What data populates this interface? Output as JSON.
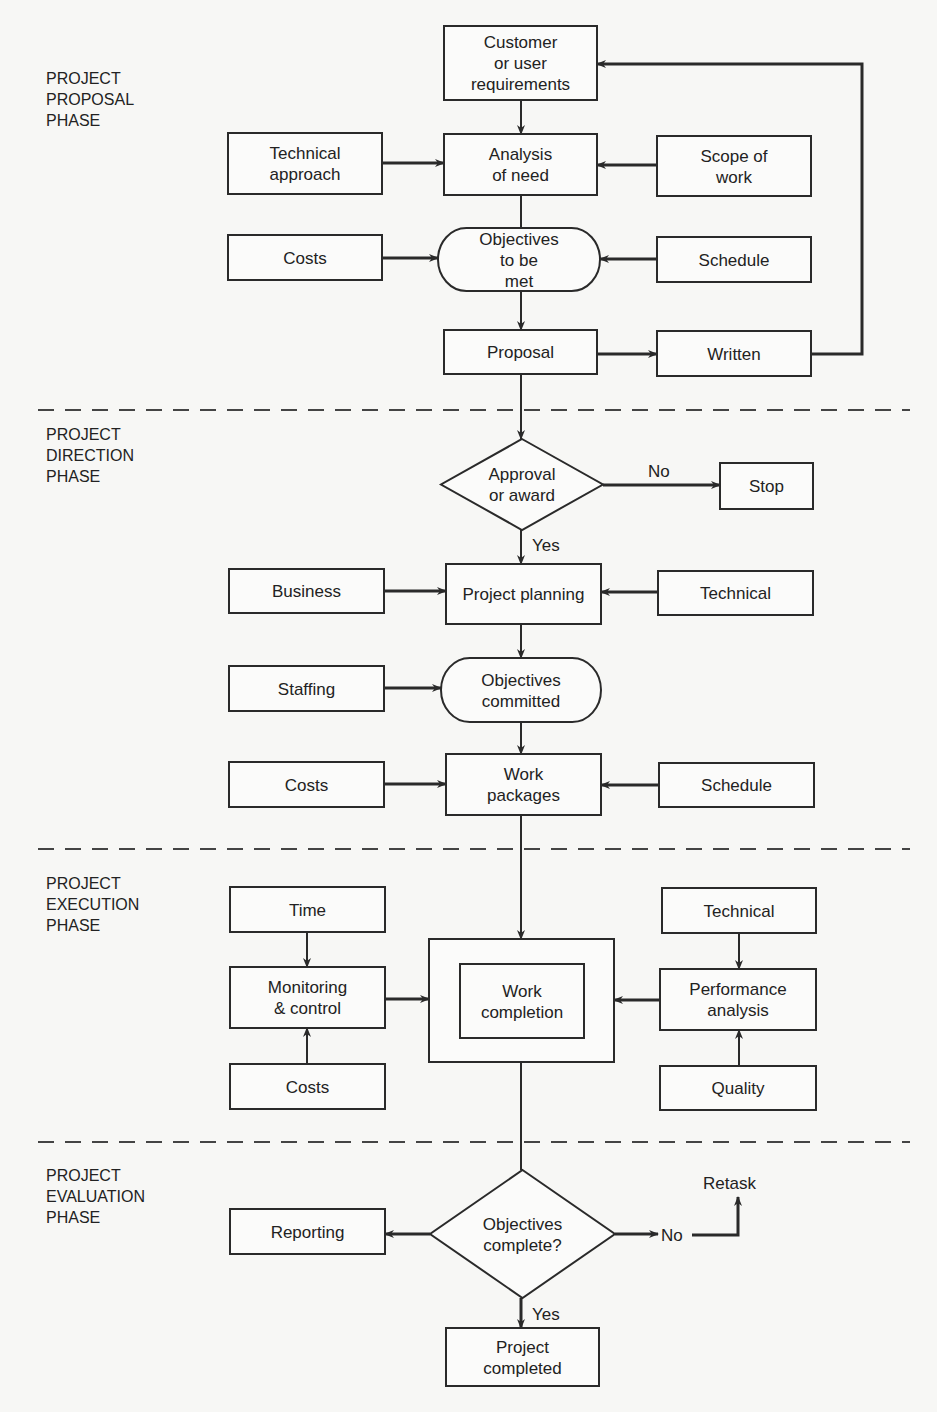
{
  "phases": [
    {
      "id": "proposal",
      "lines": [
        "PROJECT",
        "PROPOSAL",
        "PHASE"
      ],
      "x": 46,
      "y": 84
    },
    {
      "id": "direction",
      "lines": [
        "PROJECT",
        "DIRECTION",
        "PHASE"
      ],
      "x": 46,
      "y": 440
    },
    {
      "id": "execution",
      "lines": [
        "PROJECT",
        "EXECUTION",
        "PHASE"
      ],
      "x": 46,
      "y": 889
    },
    {
      "id": "evaluation",
      "lines": [
        "PROJECT",
        "EVALUATION",
        "PHASE"
      ],
      "x": 46,
      "y": 1181
    }
  ],
  "dividers": [
    410,
    849,
    1142
  ],
  "nodes": [
    {
      "id": "customer-requirements",
      "shape": "rect",
      "x": 444,
      "y": 26,
      "w": 153,
      "h": 74,
      "lines": [
        "Customer",
        "or user",
        "requirements"
      ]
    },
    {
      "id": "technical-approach",
      "shape": "rect",
      "x": 228,
      "y": 133,
      "w": 154,
      "h": 61,
      "lines": [
        "Technical",
        "approach"
      ]
    },
    {
      "id": "analysis-of-need",
      "shape": "rect",
      "x": 444,
      "y": 134,
      "w": 153,
      "h": 61,
      "lines": [
        "Analysis",
        "of need"
      ]
    },
    {
      "id": "scope-of-work",
      "shape": "rect",
      "x": 657,
      "y": 136,
      "w": 154,
      "h": 60,
      "lines": [
        "Scope of",
        "work"
      ]
    },
    {
      "id": "costs-proposal",
      "shape": "rect",
      "x": 228,
      "y": 235,
      "w": 154,
      "h": 45,
      "lines": [
        "Costs"
      ]
    },
    {
      "id": "objectives-to-be-met",
      "shape": "terminator",
      "x": 438,
      "y": 228,
      "w": 162,
      "h": 63,
      "lines": [
        "Objectives",
        "to be",
        "met"
      ]
    },
    {
      "id": "schedule-proposal",
      "shape": "rect",
      "x": 657,
      "y": 237,
      "w": 154,
      "h": 45,
      "lines": [
        "Schedule"
      ]
    },
    {
      "id": "proposal",
      "shape": "rect",
      "x": 444,
      "y": 330,
      "w": 153,
      "h": 44,
      "lines": [
        "Proposal"
      ]
    },
    {
      "id": "written",
      "shape": "rect",
      "x": 657,
      "y": 331,
      "w": 154,
      "h": 45,
      "lines": [
        "Written"
      ]
    },
    {
      "id": "approval-or-award",
      "shape": "diamond",
      "x": 441,
      "y": 439,
      "w": 162,
      "h": 91,
      "lines": [
        "Approval",
        "or award"
      ]
    },
    {
      "id": "stop",
      "shape": "rect",
      "x": 720,
      "y": 463,
      "w": 93,
      "h": 46,
      "lines": [
        "Stop"
      ]
    },
    {
      "id": "business",
      "shape": "rect",
      "x": 229,
      "y": 569,
      "w": 155,
      "h": 44,
      "lines": [
        "Business"
      ]
    },
    {
      "id": "project-planning",
      "shape": "rect",
      "x": 446,
      "y": 564,
      "w": 155,
      "h": 60,
      "lines": [
        "Project planning"
      ]
    },
    {
      "id": "technical-direction",
      "shape": "rect",
      "x": 658,
      "y": 571,
      "w": 155,
      "h": 44,
      "lines": [
        "Technical"
      ]
    },
    {
      "id": "staffing",
      "shape": "rect",
      "x": 229,
      "y": 666,
      "w": 155,
      "h": 45,
      "lines": [
        "Staffing"
      ]
    },
    {
      "id": "objectives-committed",
      "shape": "terminator",
      "x": 441,
      "y": 658,
      "w": 160,
      "h": 64,
      "lines": [
        "Objectives",
        "committed"
      ]
    },
    {
      "id": "costs-direction",
      "shape": "rect",
      "x": 229,
      "y": 762,
      "w": 155,
      "h": 45,
      "lines": [
        "Costs"
      ]
    },
    {
      "id": "work-packages",
      "shape": "rect",
      "x": 446,
      "y": 754,
      "w": 155,
      "h": 61,
      "lines": [
        "Work",
        "packages"
      ]
    },
    {
      "id": "schedule-direction",
      "shape": "rect",
      "x": 659,
      "y": 763,
      "w": 155,
      "h": 44,
      "lines": [
        "Schedule"
      ]
    },
    {
      "id": "time",
      "shape": "rect",
      "x": 230,
      "y": 887,
      "w": 155,
      "h": 45,
      "lines": [
        "Time"
      ]
    },
    {
      "id": "work-completion-outer",
      "shape": "rect",
      "x": 429,
      "y": 939,
      "w": 185,
      "h": 123,
      "lines": []
    },
    {
      "id": "work-completion",
      "shape": "rect",
      "x": 460,
      "y": 964,
      "w": 124,
      "h": 74,
      "lines": [
        "Work",
        "completion"
      ]
    },
    {
      "id": "technical-execution",
      "shape": "rect",
      "x": 662,
      "y": 888,
      "w": 154,
      "h": 45,
      "lines": [
        "Technical"
      ]
    },
    {
      "id": "monitoring-control",
      "shape": "rect",
      "x": 230,
      "y": 967,
      "w": 155,
      "h": 61,
      "lines": [
        "Monitoring",
        "& control"
      ]
    },
    {
      "id": "performance-analysis",
      "shape": "rect",
      "x": 660,
      "y": 969,
      "w": 156,
      "h": 61,
      "lines": [
        "Performance",
        "analysis"
      ]
    },
    {
      "id": "costs-execution",
      "shape": "rect",
      "x": 230,
      "y": 1064,
      "w": 155,
      "h": 45,
      "lines": [
        "Costs"
      ]
    },
    {
      "id": "quality",
      "shape": "rect",
      "x": 660,
      "y": 1066,
      "w": 156,
      "h": 44,
      "lines": [
        "Quality"
      ]
    },
    {
      "id": "reporting",
      "shape": "rect",
      "x": 230,
      "y": 1209,
      "w": 155,
      "h": 45,
      "lines": [
        "Reporting"
      ]
    },
    {
      "id": "objectives-complete",
      "shape": "diamond",
      "x": 430,
      "y": 1170,
      "w": 185,
      "h": 128,
      "lines": [
        "Objectives",
        "complete?"
      ]
    },
    {
      "id": "project-completed",
      "shape": "rect",
      "x": 446,
      "y": 1328,
      "w": 153,
      "h": 58,
      "lines": [
        "Project",
        "completed"
      ]
    }
  ],
  "edges": [
    {
      "id": "customer-to-analysis",
      "points": [
        [
          521,
          100
        ],
        [
          521,
          134
        ]
      ],
      "arrow": true
    },
    {
      "id": "technical-approach-to-analysis",
      "points": [
        [
          382,
          163
        ],
        [
          444,
          163
        ]
      ],
      "arrow": true,
      "thick": true
    },
    {
      "id": "scope-to-analysis",
      "points": [
        [
          657,
          165
        ],
        [
          597,
          165
        ]
      ],
      "arrow": true,
      "thick": true
    },
    {
      "id": "analysis-to-objectives",
      "points": [
        [
          521,
          195
        ],
        [
          521,
          228
        ]
      ],
      "arrow": false
    },
    {
      "id": "costs-to-objectives",
      "points": [
        [
          382,
          258
        ],
        [
          438,
          258
        ]
      ],
      "arrow": true,
      "thick": true
    },
    {
      "id": "schedule-to-objectives",
      "points": [
        [
          657,
          259
        ],
        [
          600,
          259
        ]
      ],
      "arrow": true,
      "thick": true
    },
    {
      "id": "objectives-to-proposal",
      "points": [
        [
          521,
          291
        ],
        [
          521,
          330
        ]
      ],
      "arrow": true
    },
    {
      "id": "proposal-to-written",
      "points": [
        [
          597,
          354
        ],
        [
          657,
          354
        ]
      ],
      "arrow": true,
      "thick": true
    },
    {
      "id": "written-feedback",
      "points": [
        [
          811,
          354
        ],
        [
          862,
          354
        ],
        [
          862,
          64
        ],
        [
          597,
          64
        ]
      ],
      "arrow": true,
      "thick": true
    },
    {
      "id": "proposal-to-approval",
      "points": [
        [
          521,
          374
        ],
        [
          521,
          439
        ]
      ],
      "arrow": true
    },
    {
      "id": "approval-to-stop",
      "points": [
        [
          603,
          485
        ],
        [
          720,
          485
        ]
      ],
      "arrow": true,
      "thick": true,
      "label": "No",
      "lx": 648,
      "ly": 477
    },
    {
      "id": "approval-to-planning",
      "points": [
        [
          521,
          530
        ],
        [
          521,
          564
        ]
      ],
      "arrow": true,
      "label": "Yes",
      "lx": 532,
      "ly": 551
    },
    {
      "id": "business-to-planning",
      "points": [
        [
          384,
          591
        ],
        [
          446,
          591
        ]
      ],
      "arrow": true,
      "thick": true
    },
    {
      "id": "technical-to-planning",
      "points": [
        [
          658,
          592
        ],
        [
          601,
          592
        ]
      ],
      "arrow": true,
      "thick": true
    },
    {
      "id": "planning-to-committed",
      "points": [
        [
          521,
          624
        ],
        [
          521,
          658
        ]
      ],
      "arrow": true
    },
    {
      "id": "staffing-to-committed",
      "points": [
        [
          384,
          688
        ],
        [
          441,
          688
        ]
      ],
      "arrow": true,
      "thick": true
    },
    {
      "id": "committed-to-packages",
      "points": [
        [
          521,
          722
        ],
        [
          521,
          754
        ]
      ],
      "arrow": true
    },
    {
      "id": "costs-to-packages",
      "points": [
        [
          384,
          784
        ],
        [
          446,
          784
        ]
      ],
      "arrow": true,
      "thick": true
    },
    {
      "id": "schedule-to-packages",
      "points": [
        [
          659,
          785
        ],
        [
          601,
          785
        ]
      ],
      "arrow": true,
      "thick": true
    },
    {
      "id": "packages-to-completion",
      "points": [
        [
          521,
          815
        ],
        [
          521,
          939
        ]
      ],
      "arrow": true
    },
    {
      "id": "time-to-monitoring",
      "points": [
        [
          307,
          932
        ],
        [
          307,
          967
        ]
      ],
      "arrow": true
    },
    {
      "id": "costs-to-monitoring",
      "points": [
        [
          307,
          1064
        ],
        [
          307,
          1028
        ]
      ],
      "arrow": true
    },
    {
      "id": "monitoring-to-completion",
      "points": [
        [
          385,
          999
        ],
        [
          429,
          999
        ]
      ],
      "arrow": true,
      "thick": true
    },
    {
      "id": "technical-to-performance",
      "points": [
        [
          739,
          933
        ],
        [
          739,
          969
        ]
      ],
      "arrow": true
    },
    {
      "id": "quality-to-performance",
      "points": [
        [
          739,
          1066
        ],
        [
          739,
          1030
        ]
      ],
      "arrow": true
    },
    {
      "id": "performance-to-completion",
      "points": [
        [
          660,
          1000
        ],
        [
          614,
          1000
        ]
      ],
      "arrow": true,
      "thick": true
    },
    {
      "id": "completion-to-evaluation",
      "points": [
        [
          521,
          1062
        ],
        [
          521,
          1170
        ]
      ],
      "arrow": false
    },
    {
      "id": "evaluation-to-reporting",
      "points": [
        [
          430,
          1234
        ],
        [
          385,
          1234
        ]
      ],
      "arrow": true,
      "thick": true
    },
    {
      "id": "evaluation-to-no",
      "points": [
        [
          615,
          1234
        ],
        [
          658,
          1234
        ]
      ],
      "arrow": true,
      "thick": true
    },
    {
      "id": "no-to-retask",
      "points": [
        [
          692,
          1235
        ],
        [
          738,
          1235
        ],
        [
          738,
          1197
        ]
      ],
      "arrow": true,
      "thick": true
    },
    {
      "id": "evaluation-to-completed",
      "points": [
        [
          521,
          1298
        ],
        [
          521,
          1328
        ]
      ],
      "arrow": true,
      "thick": true,
      "label": "Yes",
      "lx": 532,
      "ly": 1320
    }
  ],
  "free_labels": [
    {
      "id": "no-label-evaluation",
      "text": "No",
      "x": 661,
      "y": 1241
    },
    {
      "id": "retask-label",
      "text": "Retask",
      "x": 703,
      "y": 1189
    }
  ]
}
